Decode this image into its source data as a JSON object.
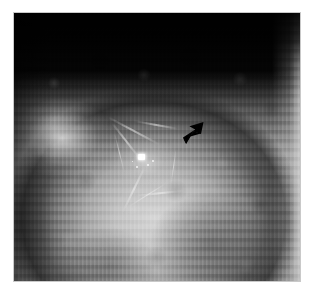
{
  "viewer": {
    "label": "mammogram-image-viewer",
    "width": 313,
    "height": 293,
    "background_color": "#ffffff"
  },
  "image": {
    "name": "mammogram-radiograph",
    "modality": "Mammography X-ray",
    "view_description": "Grayscale mammographic view of breast parenchyma with dense fibroglandular tissue rising as a dome from the lower border against a black air field at the top.",
    "frame_color": "#c9c9c9",
    "air_field_color": "#050505",
    "tissue_bright_color": "#d7d7d7",
    "tissue_mid_color": "#a8a8a8",
    "tissue_dark_color": "#3a3a3a",
    "caption": ""
  },
  "findings": [
    {
      "name": "spiculated-mass",
      "label": "Spiculated mass",
      "center_x": 132,
      "center_y": 150,
      "description": "Ill-defined radiodense focus with radiating linear spiculations"
    },
    {
      "name": "microcalcification",
      "label": "Microcalcification",
      "center_x": 142,
      "center_y": 157,
      "color": "#ffffff",
      "description": "Punctate high-density bright speck within the lesion"
    }
  ],
  "annotation": {
    "name": "pointer-arrow",
    "label": "Arrow marker",
    "color": "#000000",
    "tip_x": 186,
    "tip_y": 143,
    "direction": "down-left",
    "description": "Solid black arrowhead indicating the lesion"
  },
  "spiculations": [
    {
      "angle": -62,
      "length": 58,
      "thickness": 2.0,
      "x": 120,
      "y": 118
    },
    {
      "angle": -38,
      "length": 46,
      "thickness": 1.6,
      "x": 112,
      "y": 128
    },
    {
      "angle": -14,
      "length": 40,
      "thickness": 1.4,
      "x": 106,
      "y": 140
    },
    {
      "angle": 26,
      "length": 52,
      "thickness": 1.6,
      "x": 120,
      "y": 176
    },
    {
      "angle": 58,
      "length": 44,
      "thickness": 1.4,
      "x": 134,
      "y": 182
    },
    {
      "angle": 84,
      "length": 50,
      "thickness": 1.5,
      "x": 146,
      "y": 180
    },
    {
      "angle": -80,
      "length": 44,
      "thickness": 1.8,
      "x": 142,
      "y": 112
    },
    {
      "angle": 8,
      "length": 36,
      "thickness": 1.2,
      "x": 160,
      "y": 154
    }
  ],
  "calc_specks": [
    {
      "x": 133,
      "y": 151,
      "size": 2
    },
    {
      "x": 122,
      "y": 153,
      "size": 2
    },
    {
      "x": 138,
      "y": 147,
      "size": 2
    },
    {
      "x": 118,
      "y": 148,
      "size": 1
    }
  ]
}
